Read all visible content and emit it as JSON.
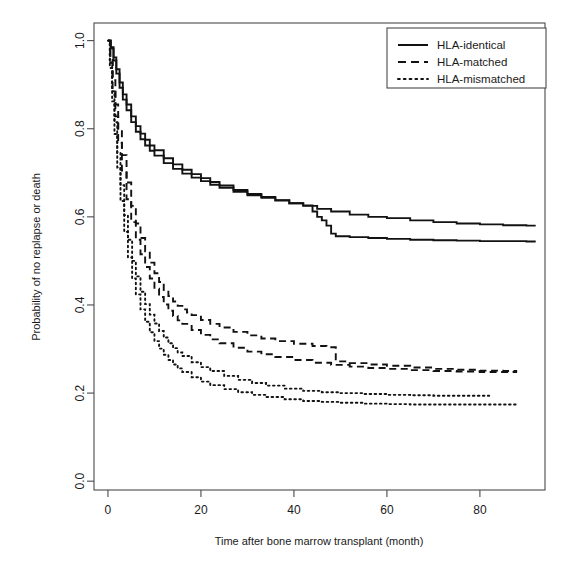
{
  "figure": {
    "width": 568,
    "height": 581,
    "background": "#ffffff",
    "ink_color": "#121212",
    "frame_color": "#4a4a4a"
  },
  "chart_data": {
    "type": "line",
    "subtype": "kaplan-meier-survival",
    "title": "",
    "xlabel": "Time after bone marrow transplant (month)",
    "ylabel": "Probability of no replapse or death",
    "xlim": [
      -3,
      94
    ],
    "ylim": [
      -0.02,
      1.04
    ],
    "xticks": [
      0,
      20,
      40,
      60,
      80
    ],
    "xticklabels": [
      "0",
      "20",
      "40",
      "60",
      "80"
    ],
    "yticks": [
      0.0,
      0.2,
      0.4,
      0.6,
      0.8,
      1.0
    ],
    "yticklabels": [
      "0.0",
      "0.2",
      "0.4",
      "0.6",
      "0.8",
      "1.0"
    ],
    "grid": false,
    "legend_position": "top-right",
    "legend_entries": [
      {
        "label": "HLA-identical",
        "style": "solid"
      },
      {
        "label": "HLA-matched",
        "style": "dashed"
      },
      {
        "label": "HLA-mismatched",
        "style": "dotted"
      }
    ],
    "series": [
      {
        "name": "HLA-identical (upper)",
        "style": "solid",
        "x": [
          0,
          0.6,
          1.2,
          1.8,
          2.5,
          3.2,
          4,
          5,
          6,
          7,
          8,
          9,
          10,
          12,
          14,
          16,
          18,
          20,
          22,
          24,
          27,
          30,
          33,
          36,
          39,
          42,
          45,
          48,
          52,
          56,
          60,
          65,
          70,
          75,
          80,
          85,
          90,
          92
        ],
        "y": [
          1.0,
          0.985,
          0.962,
          0.935,
          0.905,
          0.878,
          0.855,
          0.828,
          0.806,
          0.789,
          0.775,
          0.762,
          0.751,
          0.733,
          0.719,
          0.707,
          0.697,
          0.688,
          0.679,
          0.671,
          0.661,
          0.652,
          0.645,
          0.638,
          0.631,
          0.625,
          0.618,
          0.612,
          0.605,
          0.6,
          0.597,
          0.592,
          0.588,
          0.585,
          0.583,
          0.581,
          0.58,
          0.58
        ]
      },
      {
        "name": "HLA-identical (lower)",
        "style": "solid",
        "x": [
          0,
          0.6,
          1.2,
          1.8,
          2.5,
          3.2,
          4,
          5,
          6,
          7,
          8,
          9,
          10,
          12,
          14,
          16,
          18,
          20,
          22,
          24,
          27,
          30,
          33,
          36,
          39,
          42,
          44,
          45,
          46,
          47,
          48,
          49,
          52,
          56,
          60,
          65,
          70,
          75,
          80,
          85,
          90,
          92
        ],
        "y": [
          1.0,
          0.982,
          0.955,
          0.925,
          0.893,
          0.866,
          0.842,
          0.815,
          0.793,
          0.776,
          0.762,
          0.75,
          0.739,
          0.722,
          0.709,
          0.698,
          0.689,
          0.681,
          0.673,
          0.666,
          0.657,
          0.649,
          0.643,
          0.637,
          0.631,
          0.626,
          0.612,
          0.6,
          0.592,
          0.58,
          0.562,
          0.556,
          0.554,
          0.552,
          0.55,
          0.548,
          0.547,
          0.546,
          0.545,
          0.545,
          0.544,
          0.544
        ]
      },
      {
        "name": "HLA-matched (upper)",
        "style": "dashed",
        "x": [
          0,
          0.5,
          1,
          1.6,
          2.2,
          3,
          4,
          5,
          6,
          7,
          8,
          9,
          10,
          11,
          12,
          13,
          14,
          15,
          16,
          17,
          18,
          20,
          22,
          24,
          27,
          30,
          33,
          36,
          40,
          44,
          47,
          48,
          49,
          52,
          56,
          60,
          65,
          70,
          75,
          80,
          85,
          88
        ],
        "y": [
          1.0,
          0.962,
          0.91,
          0.855,
          0.8,
          0.74,
          0.678,
          0.625,
          0.585,
          0.552,
          0.522,
          0.496,
          0.472,
          0.452,
          0.434,
          0.42,
          0.408,
          0.398,
          0.39,
          0.383,
          0.377,
          0.366,
          0.357,
          0.349,
          0.339,
          0.331,
          0.324,
          0.318,
          0.312,
          0.307,
          0.304,
          0.304,
          0.272,
          0.268,
          0.265,
          0.262,
          0.258,
          0.255,
          0.253,
          0.251,
          0.25,
          0.25
        ]
      },
      {
        "name": "HLA-matched (lower)",
        "style": "dashed",
        "x": [
          0,
          0.5,
          1,
          1.6,
          2.2,
          3,
          4,
          5,
          6,
          7,
          8,
          9,
          10,
          11,
          12,
          13,
          14,
          15,
          16,
          18,
          20,
          22,
          24,
          27,
          30,
          33,
          36,
          40,
          44,
          48,
          52,
          56,
          60,
          65,
          70,
          75,
          80,
          85,
          88
        ],
        "y": [
          1.0,
          0.95,
          0.89,
          0.828,
          0.768,
          0.705,
          0.64,
          0.588,
          0.548,
          0.515,
          0.486,
          0.46,
          0.437,
          0.418,
          0.401,
          0.387,
          0.375,
          0.365,
          0.357,
          0.343,
          0.332,
          0.322,
          0.313,
          0.303,
          0.294,
          0.288,
          0.282,
          0.275,
          0.269,
          0.264,
          0.26,
          0.257,
          0.255,
          0.252,
          0.25,
          0.249,
          0.248,
          0.248,
          0.248
        ]
      },
      {
        "name": "HLA-mismatched (upper)",
        "style": "dotted",
        "x": [
          0,
          0.4,
          0.9,
          1.4,
          2,
          2.7,
          3.5,
          4.3,
          5.2,
          6,
          7,
          8,
          9,
          10,
          11,
          12,
          13,
          14,
          15,
          16,
          18,
          20,
          22,
          25,
          28,
          31,
          34,
          38,
          42,
          46,
          50,
          55,
          60,
          65,
          70,
          75,
          80,
          82
        ],
        "y": [
          1.0,
          0.95,
          0.885,
          0.815,
          0.745,
          0.672,
          0.604,
          0.548,
          0.5,
          0.465,
          0.43,
          0.402,
          0.378,
          0.358,
          0.341,
          0.326,
          0.313,
          0.302,
          0.292,
          0.284,
          0.27,
          0.259,
          0.25,
          0.239,
          0.23,
          0.223,
          0.217,
          0.21,
          0.205,
          0.202,
          0.2,
          0.198,
          0.196,
          0.195,
          0.194,
          0.194,
          0.194,
          0.194
        ]
      },
      {
        "name": "HLA-mismatched (lower)",
        "style": "dotted",
        "x": [
          0,
          0.4,
          0.9,
          1.4,
          2,
          2.7,
          3.5,
          4.3,
          5.2,
          6,
          7,
          8,
          9,
          10,
          11,
          12,
          13,
          14,
          15,
          16,
          18,
          20,
          22,
          25,
          28,
          31,
          34,
          38,
          42,
          46,
          50,
          55,
          60,
          65,
          70,
          75,
          80,
          85,
          88
        ],
        "y": [
          1.0,
          0.938,
          0.862,
          0.788,
          0.712,
          0.636,
          0.566,
          0.508,
          0.46,
          0.424,
          0.39,
          0.362,
          0.338,
          0.318,
          0.301,
          0.287,
          0.275,
          0.265,
          0.256,
          0.248,
          0.236,
          0.226,
          0.218,
          0.209,
          0.202,
          0.196,
          0.191,
          0.186,
          0.182,
          0.18,
          0.178,
          0.176,
          0.175,
          0.174,
          0.174,
          0.174,
          0.174,
          0.174,
          0.174
        ]
      }
    ]
  },
  "axes": {
    "x_title": "Time after bone marrow transplant (month)",
    "y_title": "Probability of no replapse or death"
  },
  "legend": {
    "items": [
      {
        "label": "HLA-identical",
        "key": "solid-line-key"
      },
      {
        "label": "HLA-matched",
        "key": "dashed-line-key"
      },
      {
        "label": "HLA-mismatched",
        "key": "dotted-line-key"
      }
    ]
  }
}
